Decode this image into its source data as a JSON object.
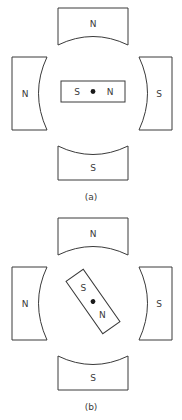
{
  "figure": {
    "line_color": "#3a3a3a",
    "background_color": "#ffffff",
    "dot_color": "#1a1a1a"
  },
  "panels": [
    {
      "id": "a",
      "caption": "(a)",
      "needle_angle_deg": 0,
      "poles": [
        {
          "position": "top",
          "label": "N"
        },
        {
          "position": "left",
          "label": "N"
        },
        {
          "position": "right",
          "label": "S"
        },
        {
          "position": "bottom",
          "label": "S"
        }
      ],
      "needle": {
        "left_label": "S",
        "right_label": "N",
        "pivot": "dot"
      }
    },
    {
      "id": "b",
      "caption": "(b)",
      "needle_angle_deg": 55,
      "poles": [
        {
          "position": "top",
          "label": "N"
        },
        {
          "position": "left",
          "label": "N"
        },
        {
          "position": "right",
          "label": "S"
        },
        {
          "position": "bottom",
          "label": "S"
        }
      ],
      "needle": {
        "left_label": "S",
        "right_label": "N",
        "pivot": "dot"
      }
    }
  ]
}
